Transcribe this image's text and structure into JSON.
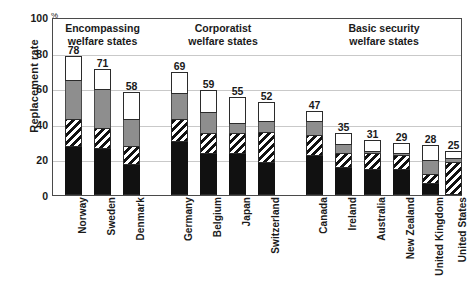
{
  "chart_data": {
    "type": "bar",
    "subtype": "stacked-bar",
    "title": "",
    "xlabel": "",
    "ylabel": "Replacement rate",
    "yunit": "%",
    "ylim": [
      0,
      100
    ],
    "yticks": [
      0,
      20,
      40,
      60,
      80,
      100
    ],
    "grid": true,
    "legend": null,
    "legend_position": "none",
    "categories": [
      "Norway",
      "Sweden",
      "Denmark",
      "Germany",
      "Belgium",
      "Japan",
      "Switzerland",
      "Canada",
      "Ireland",
      "Australia",
      "New Zealand",
      "United Kingdom",
      "United States"
    ],
    "totals": [
      78,
      71,
      58,
      69,
      59,
      55,
      52,
      47,
      35,
      31,
      29,
      28,
      25
    ],
    "series": [
      {
        "name": "segment-1-black",
        "fill": "black",
        "values": [
          27,
          26,
          17,
          30,
          23,
          23,
          18,
          22,
          15,
          14,
          14,
          6,
          0
        ]
      },
      {
        "name": "segment-2-hatched",
        "fill": "diagonal-hatch",
        "values": [
          15,
          11,
          10,
          12,
          11,
          11,
          17,
          11,
          8,
          9,
          8,
          5,
          18
        ]
      },
      {
        "name": "segment-3-gray",
        "fill": "gray",
        "values": [
          22,
          22,
          15,
          15,
          12,
          6,
          6,
          8,
          5,
          1,
          1,
          8,
          2
        ]
      },
      {
        "name": "segment-4-white",
        "fill": "white",
        "values": [
          14,
          12,
          16,
          12,
          13,
          15,
          11,
          6,
          7,
          7,
          6,
          9,
          5
        ]
      }
    ],
    "groups": [
      {
        "label_line1": "Encompassing",
        "label_line2": "welfare states",
        "members": [
          "Norway",
          "Sweden",
          "Denmark"
        ]
      },
      {
        "label_line1": "Corporatist",
        "label_line2": "welfare states",
        "members": [
          "Germany",
          "Belgium",
          "Japan",
          "Switzerland"
        ]
      },
      {
        "label_line1": "Basic security",
        "label_line2": "welfare states",
        "members": [
          "Canada",
          "Ireland",
          "Australia",
          "New Zealand",
          "United Kingdom",
          "United States"
        ]
      }
    ]
  }
}
